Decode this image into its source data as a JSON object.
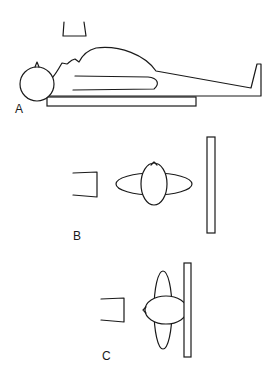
{
  "figure": {
    "panels": [
      {
        "id": "A",
        "label": "A",
        "description": "Patient lying supine on table, lateral view, with x-ray tube above"
      },
      {
        "id": "B",
        "label": "B",
        "description": "Axial view: tube on left, patient cross-section (head and body), detector plate on right"
      },
      {
        "id": "C",
        "label": "C",
        "description": "Axial view: tube on left, patient rotated lateral against detector plate"
      }
    ],
    "colors": {
      "stroke": "#1a1a1a",
      "background": "#ffffff"
    }
  }
}
